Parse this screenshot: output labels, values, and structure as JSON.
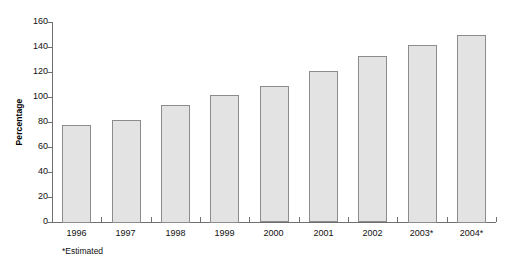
{
  "chart_data": {
    "type": "bar",
    "title": "",
    "subtitle": "",
    "xlabel": "",
    "ylabel": "Percentage",
    "categories": [
      "1996",
      "1997",
      "1998",
      "1999",
      "2000",
      "2001",
      "2002",
      "2003*",
      "2004*"
    ],
    "values": [
      78,
      82,
      94,
      102,
      109,
      121,
      133,
      142,
      150
    ],
    "ylim": [
      0,
      160
    ],
    "y_ticks": [
      0,
      20,
      40,
      60,
      80,
      100,
      120,
      140,
      160
    ],
    "y_tick_labels": [
      "0",
      "20",
      "40",
      "60",
      "80",
      "100",
      "120",
      "140",
      "160"
    ],
    "grid": false,
    "legend": null,
    "annotations": [
      "*Estimated"
    ],
    "bar_fill_color": "#e3e3e3",
    "bar_border_color": "#8c8c8c",
    "axis_color": "#6f6f6f",
    "background_color": "#ffffff"
  },
  "footnote": {
    "text": "*Estimated"
  }
}
